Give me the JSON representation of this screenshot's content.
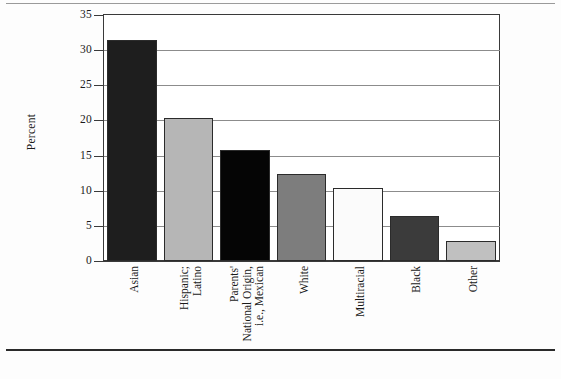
{
  "figure": {
    "background_color": "#fdfdfd",
    "frame_color": "#3a3a3a",
    "gridline_color": "#8c8c8c"
  },
  "chart_data": {
    "type": "bar",
    "title": "",
    "xlabel": "",
    "ylabel": "Percent",
    "ylim": [
      0,
      35
    ],
    "ytick_values": [
      0,
      5,
      10,
      15,
      20,
      25,
      30,
      35
    ],
    "ytick_labels": [
      "0",
      "5",
      "10",
      "15",
      "20",
      "25",
      "30",
      "35"
    ],
    "grid": true,
    "legend": "none",
    "categories": [
      "Asian",
      "Hispanic; Latino",
      "Parents' National Origin, i.e., Mexican",
      "White",
      "Multiracial",
      "Black",
      "Other"
    ],
    "category_lines": [
      [
        "Asian"
      ],
      [
        "Hispanic;",
        "Latino"
      ],
      [
        "Parents'",
        "National Origin,",
        "i.e., Mexican"
      ],
      [
        "White"
      ],
      [
        "Multiracial"
      ],
      [
        "Black"
      ],
      [
        "Other"
      ]
    ],
    "values": [
      31.4,
      20.4,
      15.8,
      12.4,
      10.4,
      6.4,
      2.9
    ],
    "bar_colors": [
      "#1e1e1e",
      "#b6b6b6",
      "#050505",
      "#7d7d7d",
      "#fbfbfb",
      "#3b3b3b",
      "#c0c0c0"
    ],
    "bar_edge_color": "#2b2b2b"
  }
}
